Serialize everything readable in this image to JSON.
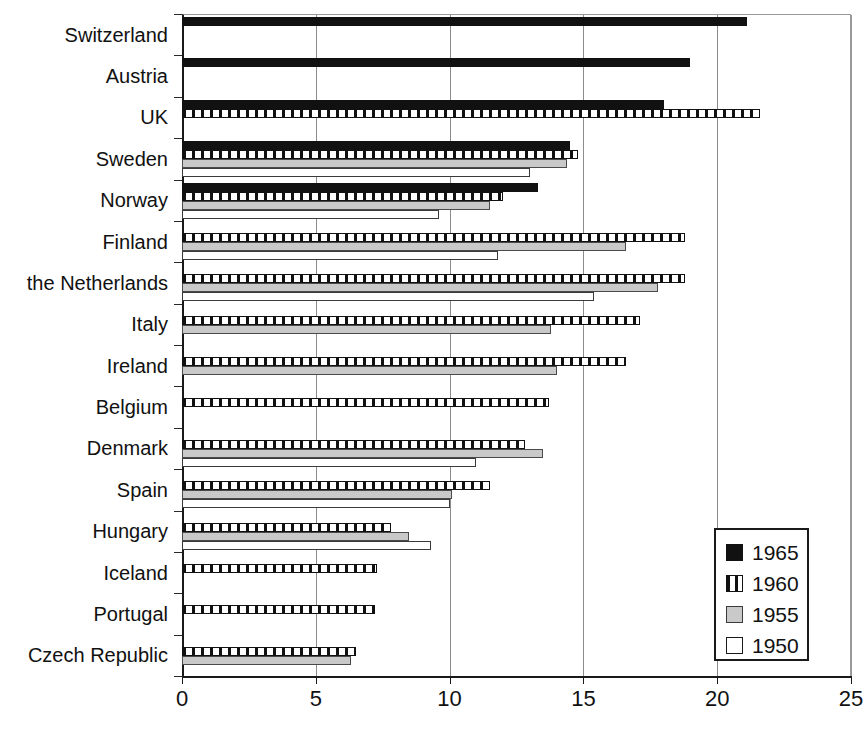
{
  "chart_data": {
    "type": "bar",
    "orientation": "horizontal",
    "title": "",
    "xlabel": "",
    "ylabel": "",
    "xlim": [
      0,
      25
    ],
    "xticks": [
      0,
      5,
      10,
      15,
      20,
      25
    ],
    "xtick_labels": [
      "0",
      "5",
      "10",
      "15",
      "20",
      "25"
    ],
    "grid": "vertical",
    "legend_position": "bottom-right",
    "categories": [
      "Switzerland",
      "Austria",
      "UK",
      "Sweden",
      "Norway",
      "Finland",
      "the Netherlands",
      "Italy",
      "Ireland",
      "Belgium",
      "Denmark",
      "Spain",
      "Hungary",
      "Iceland",
      "Portugal",
      "Czech Republic"
    ],
    "series": [
      {
        "name": "1965",
        "color": "#111111",
        "pattern": "solid-black",
        "values": [
          21.1,
          19.0,
          18.0,
          14.5,
          13.3,
          null,
          null,
          null,
          null,
          null,
          null,
          null,
          null,
          null,
          null,
          null
        ]
      },
      {
        "name": "1960",
        "color": "#111111",
        "pattern": "vertical-hatch",
        "values": [
          null,
          null,
          21.6,
          14.8,
          12.0,
          18.8,
          18.8,
          17.1,
          16.6,
          13.7,
          12.8,
          11.5,
          7.8,
          7.3,
          7.2,
          6.5
        ]
      },
      {
        "name": "1955",
        "color": "#c9c9c9",
        "pattern": "light-grey",
        "values": [
          null,
          null,
          null,
          14.4,
          11.5,
          16.6,
          17.8,
          13.8,
          14.0,
          null,
          13.5,
          10.1,
          8.5,
          null,
          null,
          6.3
        ]
      },
      {
        "name": "1950",
        "color": "#ffffff",
        "pattern": "white",
        "values": [
          null,
          null,
          null,
          13.0,
          9.6,
          11.8,
          15.4,
          null,
          null,
          null,
          11.0,
          10.0,
          9.3,
          null,
          null,
          null
        ]
      }
    ]
  },
  "legend": {
    "entries": [
      {
        "label": "1965",
        "swatch": "s1965"
      },
      {
        "label": "1960",
        "swatch": "s1960"
      },
      {
        "label": "1955",
        "swatch": "s1955"
      },
      {
        "label": "1950",
        "swatch": "s1950"
      }
    ]
  }
}
